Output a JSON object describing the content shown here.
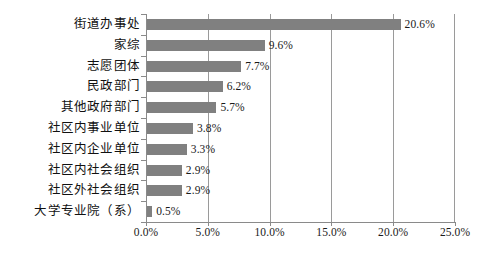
{
  "chart_data": {
    "type": "bar",
    "orientation": "horizontal",
    "title": "",
    "xlabel": "",
    "ylabel": "",
    "xlim": [
      0,
      25
    ],
    "xticks": [
      "0.0%",
      "5.0%",
      "10.0%",
      "15.0%",
      "20.0%",
      "25.0%"
    ],
    "xtick_values": [
      0,
      5,
      10,
      15,
      20,
      25
    ],
    "grid": true,
    "legend": "none",
    "bar_color": "#808080",
    "categories": [
      "街道办事处",
      "家综",
      "志愿团体",
      "民政部门",
      "其他政府部门",
      "社区内事业单位",
      "社区内企业单位",
      "社区内社会组织",
      "社区外社会组织",
      "大学专业院（系）"
    ],
    "values": [
      20.6,
      9.6,
      7.7,
      6.2,
      5.7,
      3.8,
      3.3,
      2.9,
      2.9,
      0.5
    ],
    "data_labels": [
      "20.6%",
      "9.6%",
      "7.7%",
      "6.2%",
      "5.7%",
      "3.8%",
      "3.3%",
      "2.9%",
      "2.9%",
      "0.5%"
    ]
  }
}
